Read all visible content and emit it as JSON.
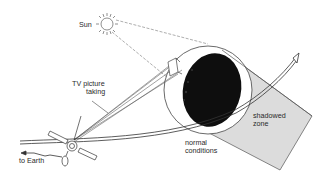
{
  "diagram": {
    "labels": {
      "sun": "Sun",
      "tv_line1": "TV picture",
      "tv_line2": "taking",
      "to_earth": "to Earth",
      "normal_line1": "normal",
      "normal_line2": "conditions",
      "shadow_line1": "shadowed",
      "shadow_line2": "zone"
    },
    "colors": {
      "line": "#4a4a4a",
      "nucleus_dark": "#0e0e0e",
      "shadow_zone": "#dcdcdc",
      "background": "#ffffff"
    }
  }
}
